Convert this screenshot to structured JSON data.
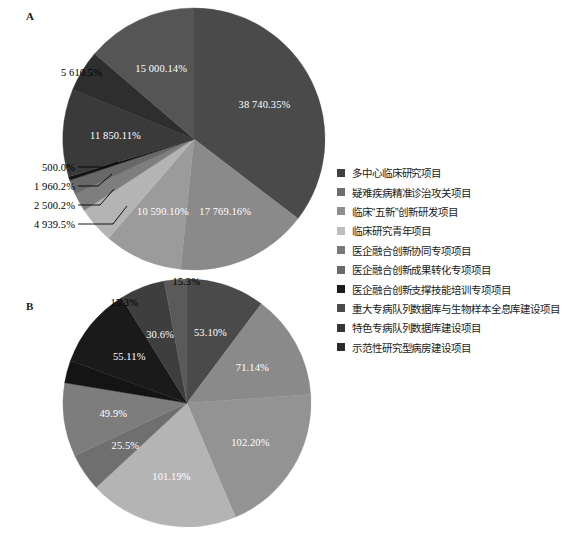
{
  "figure": {
    "panels": [
      {
        "letter": "A"
      },
      {
        "letter": "B"
      }
    ]
  },
  "legend": {
    "position": "right",
    "items": [
      {
        "label": "多中心临床研究项目",
        "color": "#3f3f3f"
      },
      {
        "label": "疑难疾病精准诊治攻关项目",
        "color": "#6e6e6e"
      },
      {
        "label": "临床“五新”创新研发项目",
        "color": "#8f8f8f"
      },
      {
        "label": "临床研究青年项目",
        "color": "#bdbdbd"
      },
      {
        "label": "医企融合创新协同专项项目",
        "color": "#7a7a7a"
      },
      {
        "label": "医企融合创新成果转化专项项目",
        "color": "#6a6a6a"
      },
      {
        "label": "医企融合创新支撑技能培训专项项目",
        "color": "#1c1c1c"
      },
      {
        "label": "重大专病队列数据库与生物样本全息库建设项目",
        "color": "#4a4a4a"
      },
      {
        "label": "特色专病队列数据库建设项目",
        "color": "#353535"
      },
      {
        "label": "示范性研究型病房建设项目",
        "color": "#2b2b2b"
      }
    ]
  },
  "chart_data": [
    {
      "type": "pie",
      "title": "A",
      "panel": "A",
      "unit": "%",
      "labels_outside": [
        "5 610.5%",
        "500.0%",
        "1 960.2%",
        "2 500.2%",
        "4 939.5%"
      ],
      "slices": [
        {
          "category": "多中心临床研究项目",
          "label": "38 740.35%",
          "value": 38740.35,
          "color": "#4a4a4a",
          "label_placement": "inside"
        },
        {
          "category": "疑难疾病精准诊治攻关项目",
          "label": "17 769.16%",
          "value": 17769.16,
          "color": "#8a8a8a",
          "label_placement": "inside"
        },
        {
          "category": "临床“五新”创新研发项目",
          "label": "10 590.10%",
          "value": 10590.1,
          "color": "#9b9b9b",
          "label_placement": "inside"
        },
        {
          "category": "临床研究青年项目",
          "label": "4 939.5%",
          "value": 4939.5,
          "color": "#b4b4b4",
          "label_placement": "outside"
        },
        {
          "category": "医企融合创新协同专项项目",
          "label": "2 500.2%",
          "value": 2500.2,
          "color": "#7e7e7e",
          "label_placement": "outside"
        },
        {
          "category": "医企融合创新成果转化专项项目",
          "label": "1 960.2%",
          "value": 1960.2,
          "color": "#686868",
          "label_placement": "outside"
        },
        {
          "category": "医企融合创新支撑技能培训专项项目",
          "label": "500.0%",
          "value": 500.0,
          "color": "#141414",
          "label_placement": "outside"
        },
        {
          "category": "重大专病队列数据库与生物样本全息库建设项目",
          "label": "11 850.11%",
          "value": 11850.11,
          "color": "#3a3a3a",
          "label_placement": "inside"
        },
        {
          "category": "特色专病队列数据库建设项目",
          "label": "5 610.5%",
          "value": 5610.5,
          "color": "#2e2e2e",
          "label_placement": "outside"
        },
        {
          "category": "示范性研究型病房建设项目",
          "label": "15 000.14%",
          "value": 15000.14,
          "color": "#555555",
          "label_placement": "inside"
        }
      ]
    },
    {
      "type": "pie",
      "title": "B",
      "panel": "B",
      "unit": "%",
      "labels_outside": [
        "15.3%",
        "15.3%"
      ],
      "slices": [
        {
          "category": "多中心临床研究项目",
          "label": "53.10%",
          "value": 53.1,
          "color": "#4a4a4a",
          "label_placement": "inside"
        },
        {
          "category": "疑难疾病精准诊治攻关项目",
          "label": "71.14%",
          "value": 71.14,
          "color": "#8a8a8a",
          "label_placement": "inside"
        },
        {
          "category": "临床“五新”创新研发项目",
          "label": "102.20%",
          "value": 102.2,
          "color": "#939393",
          "label_placement": "inside"
        },
        {
          "category": "临床研究青年项目",
          "label": "101.19%",
          "value": 101.19,
          "color": "#b4b4b4",
          "label_placement": "inside"
        },
        {
          "category": "医企融合创新协同专项项目",
          "label": "25.5%",
          "value": 25.5,
          "color": "#6f6f6f",
          "label_placement": "inside"
        },
        {
          "category": "医企融合创新成果转化专项项目",
          "label": "49.9%",
          "value": 49.9,
          "color": "#7d7d7d",
          "label_placement": "inside"
        },
        {
          "category": "医企融合创新支撑技能培训专项项目",
          "label": "15.3%",
          "value": 15.3,
          "color": "#141414",
          "label_placement": "outside"
        },
        {
          "category": "重大专病队列数据库与生物样本全息库建设项目",
          "label": "55.11%",
          "value": 55.11,
          "color": "#1a1a1a",
          "label_placement": "inside"
        },
        {
          "category": "特色专病队列数据库建设项目",
          "label": "30.6%",
          "value": 30.6,
          "color": "#3e3e3e",
          "label_placement": "inside"
        },
        {
          "category": "示范性研究型病房建设项目",
          "label": "15.3%",
          "value": 15.3,
          "color": "#5a5a5a",
          "label_placement": "outside"
        }
      ]
    }
  ]
}
